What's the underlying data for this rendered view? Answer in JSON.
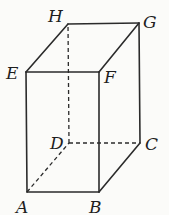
{
  "diagram": {
    "type": "rectangular-prism",
    "vertices": {
      "A": {
        "label": "A",
        "x": 27,
        "y": 192
      },
      "B": {
        "label": "B",
        "x": 99,
        "y": 192
      },
      "C": {
        "label": "C",
        "x": 140,
        "y": 143
      },
      "D": {
        "label": "D",
        "x": 69,
        "y": 143
      },
      "E": {
        "label": "E",
        "x": 26,
        "y": 72
      },
      "F": {
        "label": "F",
        "x": 99,
        "y": 72
      },
      "G": {
        "label": "G",
        "x": 139,
        "y": 23
      },
      "H": {
        "label": "H",
        "x": 68,
        "y": 24
      }
    },
    "visible_edges": [
      "AB",
      "BF",
      "FE",
      "EA",
      "EH",
      "HG",
      "GF",
      "GC",
      "CB"
    ],
    "hidden_edges": [
      "AD",
      "DC",
      "DH"
    ],
    "labels": {
      "A": "A",
      "B": "B",
      "C": "C",
      "D": "D",
      "E": "E",
      "F": "F",
      "G": "G",
      "H": "H"
    }
  }
}
